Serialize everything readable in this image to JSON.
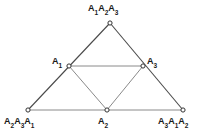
{
  "figure": {
    "background_color": "#ffffff",
    "stroke_color": "#555555",
    "node_fill_color": "#ffffff",
    "node_stroke_color": "#333333",
    "label_color": "#1a1a1a",
    "nodes": [
      {
        "id": "apex",
        "name": "vertex-apex",
        "x": 110,
        "y": 23,
        "label_plain": "A1A2A3",
        "label_parts": [
          [
            "A",
            "1"
          ],
          [
            "A",
            "2"
          ],
          [
            "A",
            "3"
          ]
        ]
      },
      {
        "id": "left",
        "name": "vertex-mid-left",
        "x": 69,
        "y": 66,
        "label_plain": "A1",
        "label_parts": [
          [
            "A",
            "1"
          ]
        ]
      },
      {
        "id": "right",
        "name": "vertex-mid-right",
        "x": 143,
        "y": 66,
        "label_plain": "A3",
        "label_parts": [
          [
            "A",
            "3"
          ]
        ]
      },
      {
        "id": "bl",
        "name": "vertex-bottom-left",
        "x": 28,
        "y": 110,
        "label_plain": "A2A3A1",
        "label_parts": [
          [
            "A",
            "2"
          ],
          [
            "A",
            "3"
          ],
          [
            "A",
            "1"
          ]
        ]
      },
      {
        "id": "bm",
        "name": "vertex-bottom-mid",
        "x": 107,
        "y": 110,
        "label_plain": "A2",
        "label_parts": [
          [
            "A",
            "2"
          ]
        ]
      },
      {
        "id": "br",
        "name": "vertex-bottom-right",
        "x": 183,
        "y": 110,
        "label_plain": "A3A1A2",
        "label_parts": [
          [
            "A",
            "3"
          ],
          [
            "A",
            "1"
          ],
          [
            "A",
            "2"
          ]
        ]
      }
    ],
    "edges": [
      {
        "name": "edge-bl-apex",
        "from": "bl",
        "to": "apex",
        "shade": "dark"
      },
      {
        "name": "edge-apex-br",
        "from": "apex",
        "to": "br",
        "shade": "dark"
      },
      {
        "name": "edge-bl-br",
        "from": "bl",
        "to": "br",
        "shade": "light"
      },
      {
        "name": "edge-left-right",
        "from": "left",
        "to": "right",
        "shade": "light"
      },
      {
        "name": "edge-left-bm",
        "from": "left",
        "to": "bm",
        "shade": "light"
      },
      {
        "name": "edge-bm-right",
        "from": "bm",
        "to": "right",
        "shade": "light"
      }
    ]
  },
  "labels": {
    "apex": "A1A2A3",
    "left": "A1",
    "right": "A3",
    "bottom_left": "A2A3A1",
    "bottom_mid": "A2",
    "bottom_right": "A3A1A2"
  }
}
